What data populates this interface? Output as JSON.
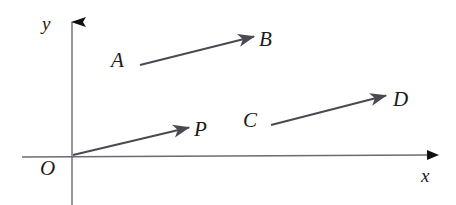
{
  "figure": {
    "kind": "vector-diagram",
    "width": 456,
    "height": 205,
    "background_color": "#ffffff"
  },
  "axes": {
    "x_axis": {
      "label": "x",
      "label_x": 421,
      "label_y": 166,
      "line_color": "#6b6b73",
      "arrow_color": "#111111",
      "x_start": 22,
      "y_start": 157,
      "x_end": 430,
      "y_end": 155
    },
    "y_axis": {
      "label": "y",
      "label_x": 42,
      "label_y": 14,
      "line_color": "#6b6b73",
      "arrow_color": "#111111",
      "x_start": 72,
      "y_start": 205,
      "x_end": 72,
      "y_end": 18
    },
    "origin": {
      "label": "O",
      "label_x": 40,
      "label_y": 158,
      "x": 72,
      "y": 155
    }
  },
  "vectors": [
    {
      "name": "OP",
      "tail_label": "O",
      "head_label": "P",
      "tail_x": 73,
      "tail_y": 155,
      "head_x": 191,
      "head_y": 127,
      "color": "#4a4a52",
      "head_label_x": 194,
      "head_label_y": 119
    },
    {
      "name": "AB",
      "tail_label": "A",
      "head_label": "B",
      "tail_x": 140,
      "tail_y": 65,
      "head_x": 256,
      "head_y": 36,
      "color": "#4a4a52",
      "tail_label_x": 111,
      "tail_label_y": 50,
      "head_label_x": 259,
      "head_label_y": 29
    },
    {
      "name": "CD",
      "tail_label": "C",
      "head_label": "D",
      "tail_x": 271,
      "tail_y": 125,
      "head_x": 388,
      "head_y": 95,
      "color": "#4a4a52",
      "tail_label_x": 243,
      "tail_label_y": 110,
      "head_label_x": 393,
      "head_label_y": 89
    }
  ],
  "labels": {
    "y": "y",
    "x": "x",
    "O": "O",
    "P": "P",
    "A": "A",
    "B": "B",
    "C": "C",
    "D": "D"
  }
}
